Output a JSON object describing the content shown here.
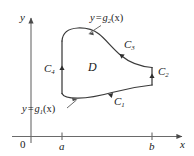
{
  "figure": {
    "background_color": "#ffffff",
    "line_color": "#3a3a3a",
    "axis_color": "#555555",
    "text_color": "#1a1a1a"
  },
  "axes": {
    "y_label": "y",
    "x_label": "x",
    "origin_label": "0",
    "ticks": [
      {
        "label": "a",
        "x_px": 62
      },
      {
        "label": "b",
        "x_px": 152
      }
    ]
  },
  "region": {
    "label": "D"
  },
  "boundary_curves": [
    {
      "name": "C",
      "sub": "1",
      "label": "C₁",
      "position": "bottom",
      "orientation": "leftward"
    },
    {
      "name": "C",
      "sub": "2",
      "label": "C₂",
      "position": "right",
      "orientation": "upward"
    },
    {
      "name": "C",
      "sub": "3",
      "label": "C₃",
      "position": "upper-right",
      "orientation": "leftward"
    },
    {
      "name": "C",
      "sub": "4",
      "label": "C₄",
      "position": "left",
      "orientation": "upward"
    }
  ],
  "function_labels": [
    {
      "id": "g2",
      "y": "y",
      "equals": "=",
      "fn": "g",
      "sub": "2",
      "arg": "(x)",
      "full": "y = g₂(x)",
      "position": "top"
    },
    {
      "id": "g1",
      "y": "y",
      "equals": "=",
      "fn": "g",
      "sub": "1",
      "arg": "(x)",
      "full": "y = g₁(x)",
      "position": "bottom-left"
    }
  ]
}
